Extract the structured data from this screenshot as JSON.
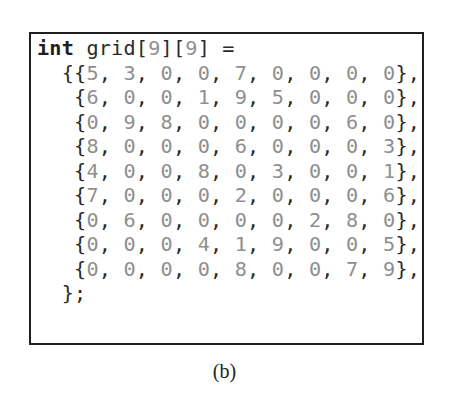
{
  "figure": {
    "caption": "(b)"
  },
  "code": {
    "declaration": {
      "keyword": "int",
      "identifier": " grid",
      "dims": [
        "9",
        "9"
      ],
      "assign": " ="
    },
    "rows": [
      [
        5,
        3,
        0,
        0,
        7,
        0,
        0,
        0,
        0
      ],
      [
        6,
        0,
        0,
        1,
        9,
        5,
        0,
        0,
        0
      ],
      [
        0,
        9,
        8,
        0,
        0,
        0,
        0,
        6,
        0
      ],
      [
        8,
        0,
        0,
        0,
        6,
        0,
        0,
        0,
        3
      ],
      [
        4,
        0,
        0,
        8,
        0,
        3,
        0,
        0,
        1
      ],
      [
        7,
        0,
        0,
        0,
        2,
        0,
        0,
        0,
        6
      ],
      [
        0,
        6,
        0,
        0,
        0,
        0,
        2,
        8,
        0
      ],
      [
        0,
        0,
        0,
        4,
        1,
        9,
        0,
        0,
        5
      ],
      [
        0,
        0,
        0,
        0,
        8,
        0,
        0,
        7,
        9
      ]
    ],
    "closing": "  };"
  },
  "colors": {
    "text": "#2a2a2a",
    "literal": "#8f8f8f",
    "border": "#1f1f1f"
  }
}
